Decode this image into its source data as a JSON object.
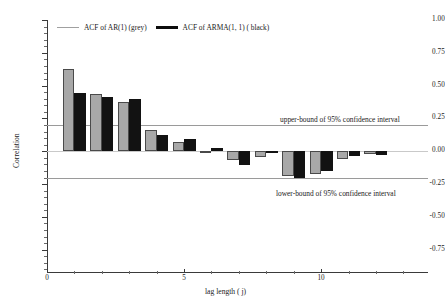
{
  "chart_data": {
    "type": "bar",
    "title": "",
    "xlabel": "lag length ( j)",
    "ylabel": "Correlation",
    "categories": [
      1,
      2,
      3,
      4,
      5,
      6,
      7,
      8,
      9,
      10,
      11,
      12
    ],
    "xlim": [
      0,
      13.9
    ],
    "ylim": [
      -0.92,
      1.0
    ],
    "xticks": [
      0,
      5,
      10
    ],
    "xtick_labels": [
      "0",
      "5",
      "10"
    ],
    "yticks": [
      1.0,
      0.75,
      0.5,
      0.25,
      0.0,
      -0.25,
      -0.5,
      -0.75
    ],
    "ytick_labels": [
      "1.00",
      "0.75",
      "0.50",
      "0.25",
      "0.00",
      "-0.25",
      "-0.50",
      "-0.75"
    ],
    "grid": false,
    "legend_position": "top-left",
    "series": [
      {
        "name": "ACF of AR(1) (grey)",
        "color": "#a8a8a8",
        "values": [
          0.625,
          0.435,
          0.375,
          0.165,
          0.07,
          0.005,
          -0.07,
          -0.045,
          -0.19,
          -0.17,
          -0.06,
          -0.02
        ]
      },
      {
        "name": "ACF of ARMA(1, 1) ( black)",
        "color": "#121212",
        "values": [
          0.445,
          0.415,
          0.395,
          0.125,
          0.09,
          0.025,
          -0.105,
          -0.01,
          -0.2,
          -0.15,
          -0.035,
          -0.025
        ]
      }
    ],
    "reference_lines": [
      {
        "name": "zero",
        "value": 0.0,
        "color": "#c9c9c9",
        "label": ""
      },
      {
        "name": "upper-ci",
        "value": 0.2,
        "color": "#9a9a9a",
        "label": "upper-bound of 95% confidence interval"
      },
      {
        "name": "lower-ci",
        "value": -0.2,
        "color": "#9a9a9a",
        "label": "lower-bound of 95% confidence interval"
      }
    ]
  },
  "legend": {
    "items": [
      {
        "label": "ACF of AR(1) (grey)",
        "swatch": "grey-line"
      },
      {
        "label": "ACF of ARMA(1, 1) ( black)",
        "swatch": "black-line"
      }
    ]
  },
  "annotations": {
    "upper_ci_label": "upper-bound of 95% confidence interval",
    "lower_ci_label": "lower-bound of 95% confidence interval"
  },
  "axes": {
    "x_title": "lag length ( j)",
    "y_title": "Correlation"
  }
}
